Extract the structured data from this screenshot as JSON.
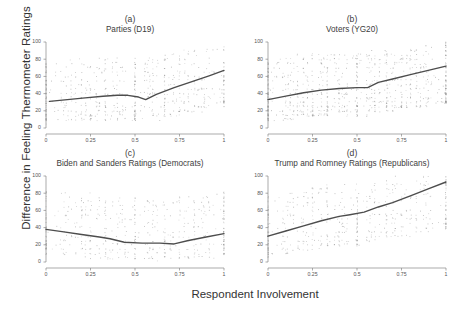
{
  "figure": {
    "xlabel": "Respondent Involvement",
    "ylabel": "Difference in Feeling Thermometer Ratings"
  },
  "chart_data": [
    {
      "type": "scatter",
      "panel": "a",
      "letter": "(a)",
      "title": "Parties (D19)",
      "xlabel": "Respondent Involvement",
      "ylabel": "Difference in Feeling Thermometer Ratings",
      "xlim": [
        0,
        1
      ],
      "ylim": [
        0,
        100
      ],
      "xticks": [
        0,
        0.25,
        0.5,
        0.75,
        1
      ],
      "xticklabels": [
        "0",
        "0.25",
        "0.5",
        "0.75",
        "1"
      ],
      "yticks": [
        0,
        20,
        40,
        60,
        80,
        100
      ],
      "yticklabels": [
        "0",
        "20",
        "40",
        "60",
        "80",
        "100"
      ],
      "grid": false,
      "legend": "none",
      "point_color": "#9a9a9a",
      "line_color": "#4d4d4d",
      "fit_line": {
        "x": [
          0.02,
          0.12,
          0.22,
          0.32,
          0.4,
          0.46,
          0.52,
          0.56,
          0.62,
          0.72,
          0.82,
          0.92,
          1.0
        ],
        "y": [
          31,
          33,
          35,
          37,
          38,
          38,
          36,
          33,
          39,
          47,
          54,
          61,
          67
        ]
      },
      "n_points": 640
    },
    {
      "type": "scatter",
      "panel": "b",
      "letter": "(b)",
      "title": "Voters (YG20)",
      "xlabel": "Respondent Involvement",
      "ylabel": "Difference in Feeling Thermometer Ratings",
      "xlim": [
        0,
        1
      ],
      "ylim": [
        0,
        100
      ],
      "xticks": [
        0,
        0.25,
        0.5,
        0.75,
        1
      ],
      "xticklabels": [
        "0",
        "0.25",
        "0.5",
        "0.75",
        "1"
      ],
      "yticks": [
        0,
        20,
        40,
        60,
        80,
        100
      ],
      "yticklabels": [
        "0",
        "20",
        "40",
        "60",
        "80",
        "100"
      ],
      "grid": false,
      "legend": "none",
      "point_color": "#9a9a9a",
      "line_color": "#4d4d4d",
      "fit_line": {
        "x": [
          0.0,
          0.1,
          0.2,
          0.3,
          0.4,
          0.5,
          0.56,
          0.62,
          0.7,
          0.8,
          0.9,
          1.0
        ],
        "y": [
          33,
          37,
          41,
          44,
          46,
          47,
          47,
          53,
          57,
          62,
          67,
          72
        ]
      },
      "n_points": 900
    },
    {
      "type": "scatter",
      "panel": "c",
      "letter": "(c)",
      "title": "Biden and Sanders Ratings (Democrats)",
      "xlabel": "Respondent Involvement",
      "ylabel": "Difference in Feeling Thermometer Ratings",
      "xlim": [
        0,
        1
      ],
      "ylim": [
        0,
        100
      ],
      "xticks": [
        0,
        0.25,
        0.5,
        0.75,
        1
      ],
      "xticklabels": [
        "0",
        "0.25",
        "0.5",
        "0.75",
        "1"
      ],
      "yticks": [
        0,
        20,
        40,
        60,
        80,
        100
      ],
      "yticklabels": [
        "0",
        "20",
        "40",
        "60",
        "80",
        "100"
      ],
      "grid": false,
      "legend": "none",
      "point_color": "#9a9a9a",
      "line_color": "#4d4d4d",
      "fit_line": {
        "x": [
          0.0,
          0.1,
          0.2,
          0.3,
          0.36,
          0.44,
          0.54,
          0.64,
          0.72,
          0.8,
          0.9,
          1.0
        ],
        "y": [
          38,
          35,
          32,
          29,
          27,
          23,
          22,
          22,
          21,
          25,
          29,
          33
        ]
      },
      "n_points": 520
    },
    {
      "type": "scatter",
      "panel": "d",
      "letter": "(d)",
      "title": "Trump and Romney Ratings (Republicans)",
      "xlabel": "Respondent Involvement",
      "ylabel": "Difference in Feeling Thermometer Ratings",
      "xlim": [
        0,
        1
      ],
      "ylim": [
        0,
        100
      ],
      "xticks": [
        0,
        0.25,
        0.5,
        0.75,
        1
      ],
      "xticklabels": [
        "0",
        "0.25",
        "0.5",
        "0.75",
        "1"
      ],
      "yticks": [
        0,
        20,
        40,
        60,
        80,
        100
      ],
      "yticklabels": [
        "0",
        "20",
        "40",
        "60",
        "80",
        "100"
      ],
      "grid": false,
      "legend": "none",
      "point_color": "#9a9a9a",
      "line_color": "#4d4d4d",
      "fit_line": {
        "x": [
          0.0,
          0.1,
          0.2,
          0.3,
          0.4,
          0.46,
          0.54,
          0.62,
          0.7,
          0.8,
          0.9,
          1.0
        ],
        "y": [
          30,
          36,
          42,
          48,
          53,
          55,
          58,
          64,
          69,
          77,
          85,
          93
        ]
      },
      "n_points": 520
    }
  ]
}
